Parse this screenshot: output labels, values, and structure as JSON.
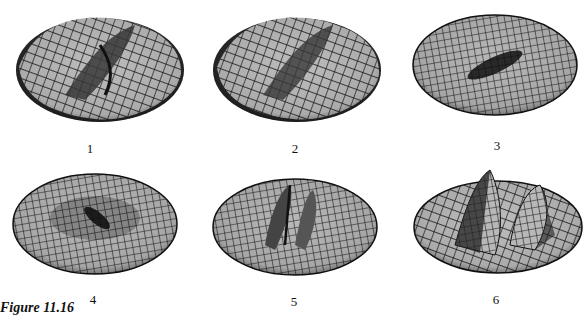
{
  "figure": {
    "caption": "Figure 11.16",
    "panels": [
      {
        "label": "1",
        "shape": "saddle-ridge, rim tilted, dark edges"
      },
      {
        "label": "2",
        "shape": "saddle-ridge, similar to 1"
      },
      {
        "label": "3",
        "shape": "flat disc with central dark trough"
      },
      {
        "label": "4",
        "shape": "flat disc with central dark depression, radial grid"
      },
      {
        "label": "5",
        "shape": "disc with two central ridges"
      },
      {
        "label": "6",
        "shape": "disc with tall twin peaks"
      }
    ]
  },
  "colors": {
    "surface_light": "#bdbdbd",
    "surface_mid": "#8a8a8a",
    "surface_dark": "#2a2a2a",
    "grid": "#111111",
    "background": "#ffffff"
  }
}
